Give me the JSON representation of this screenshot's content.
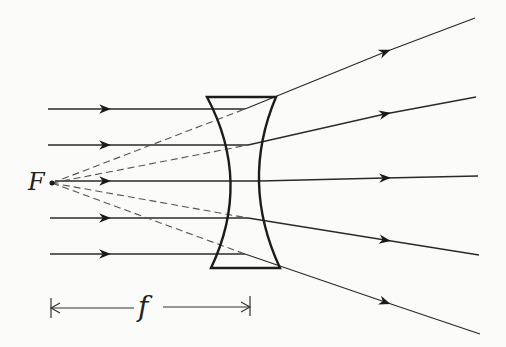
{
  "diagram": {
    "focal_point_label": "F",
    "focal_length_label": "f",
    "colors": {
      "line": "#2a2a2a",
      "dashed": "#555555",
      "background": "#fbfbfa"
    },
    "incoming_rays_y": [
      109,
      145,
      181,
      218,
      254
    ],
    "outgoing_ray_end_y": [
      18,
      97,
      176,
      255,
      334
    ]
  }
}
